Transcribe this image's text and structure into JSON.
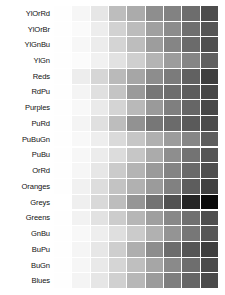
{
  "figure": {
    "background_color": "#ffffff",
    "label_color": "#111111",
    "swatches_per_row": 9,
    "row_count": 18
  },
  "chart_data": {
    "type": "heatmap",
    "xlabel": "",
    "ylabel": "",
    "grid": false,
    "legend_position": "none",
    "categories": [
      "1",
      "2",
      "3",
      "4",
      "5",
      "6",
      "7",
      "8",
      "9"
    ],
    "series": [
      {
        "name": "YlOrRd",
        "values": [
          "#fefefe",
          "#f6f6f6",
          "#e6e6e6",
          "#bdbdbd",
          "#ababab",
          "#8e8e8e",
          "#828282",
          "#6d6d6d",
          "#4d4d4d"
        ]
      },
      {
        "name": "YlOrBr",
        "values": [
          "#fefefe",
          "#fafafa",
          "#ededed",
          "#d2d2d2",
          "#bcbcbc",
          "#a0a0a0",
          "#8c8c8c",
          "#6f6f6f",
          "#555555"
        ]
      },
      {
        "name": "YlGnBu",
        "values": [
          "#fefefe",
          "#f7f7f7",
          "#ececec",
          "#d4d4d4",
          "#bdbdbd",
          "#9d9d9d",
          "#858585",
          "#6b6b6b",
          "#4f4f4f"
        ]
      },
      {
        "name": "YlGn",
        "values": [
          "#fefefe",
          "#fbfbfb",
          "#f1f1f1",
          "#e2e2e2",
          "#cfcfcf",
          "#b4b4b4",
          "#9c9c9c",
          "#858585",
          "#606060"
        ]
      },
      {
        "name": "Reds",
        "values": [
          "#fefefe",
          "#ededed",
          "#d6d6d6",
          "#bababa",
          "#a6a6a6",
          "#8d8d8d",
          "#7b7b7b",
          "#616161",
          "#3f3f3f"
        ]
      },
      {
        "name": "RdPu",
        "values": [
          "#fefefe",
          "#f4f4f4",
          "#e0e0e0",
          "#c4c4c4",
          "#9a9a9a",
          "#777777",
          "#6d6d6d",
          "#5c5c5c",
          "#474747"
        ]
      },
      {
        "name": "Purples",
        "values": [
          "#fefefe",
          "#f8f8f8",
          "#eaeaea",
          "#d4d4d4",
          "#b9b9b9",
          "#9a9a9a",
          "#7f7f7f",
          "#666666",
          "#484848"
        ]
      },
      {
        "name": "PuRd",
        "values": [
          "#fefefe",
          "#f4f4f4",
          "#e0e0e0",
          "#bdbdbd",
          "#929292",
          "#777777",
          "#6b6b6b",
          "#5a5a5a",
          "#4b4b4b"
        ]
      },
      {
        "name": "PuBuGn",
        "values": [
          "#fefefe",
          "#f8f8f8",
          "#eeeeee",
          "#dadada",
          "#c6c6c6",
          "#b0b0b0",
          "#9c9c9c",
          "#868686",
          "#5e5e5e"
        ]
      },
      {
        "name": "PuBu",
        "values": [
          "#fefefe",
          "#f7f7f7",
          "#ececec",
          "#dcdcdc",
          "#c6c6c6",
          "#ababab",
          "#8e8e8e",
          "#737373",
          "#555555"
        ]
      },
      {
        "name": "OrRd",
        "values": [
          "#fefefe",
          "#f6f6f6",
          "#e7e7e7",
          "#cbcbcb",
          "#b4b4b4",
          "#9a9a9a",
          "#848484",
          "#6a6a6a",
          "#4e4e4e"
        ]
      },
      {
        "name": "Oranges",
        "values": [
          "#fefefe",
          "#f1f1f1",
          "#dddddd",
          "#c3c3c3",
          "#b1b1b1",
          "#9b9b9b",
          "#818181",
          "#5d5d5d",
          "#414141"
        ]
      },
      {
        "name": "Greys",
        "values": [
          "#ffffff",
          "#efefef",
          "#d9d9d9",
          "#bdbdbd",
          "#969696",
          "#737373",
          "#525252",
          "#252525",
          "#0a0a0a"
        ]
      },
      {
        "name": "Greens",
        "values": [
          "#fefefe",
          "#f2f2f2",
          "#e2e2e2",
          "#cccccc",
          "#b6b6b6",
          "#9f9f9f",
          "#888888",
          "#707070",
          "#4f4f4f"
        ]
      },
      {
        "name": "GnBu",
        "values": [
          "#fefefe",
          "#f8f8f8",
          "#eeeeee",
          "#dfdfdf",
          "#cbcbcb",
          "#b1b1b1",
          "#949494",
          "#777777",
          "#575757"
        ]
      },
      {
        "name": "BuPu",
        "values": [
          "#fefefe",
          "#f5f5f5",
          "#e7e7e7",
          "#cecece",
          "#aeaeae",
          "#8d8d8d",
          "#6d6d6d",
          "#555555",
          "#3f3f3f"
        ]
      },
      {
        "name": "BuGn",
        "values": [
          "#fefefe",
          "#f6f6f6",
          "#e9e9e9",
          "#d5d5d5",
          "#bfbfbf",
          "#a6a6a6",
          "#8a8a8a",
          "#6e6e6e",
          "#4b4b4b"
        ]
      },
      {
        "name": "Blues",
        "values": [
          "#fefefe",
          "#f4f4f4",
          "#e6e6e6",
          "#d0d0d0",
          "#b7b7b7",
          "#9b9b9b",
          "#7e7e7e",
          "#666666",
          "#4a4a4a"
        ]
      }
    ]
  }
}
